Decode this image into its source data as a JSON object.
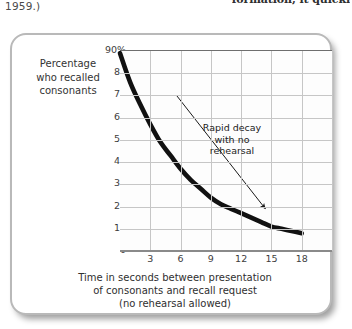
{
  "page": {
    "text_left": "1959.)",
    "text_right": "formation, it quickl"
  },
  "figure": {
    "y_axis_caption": "Percentage\nwho recalled\nconsonants",
    "x_axis_caption": "Time in seconds between presentation\nof consonants and recall request\n(no rehearsal allowed)",
    "annotation": "Rapid decay\nwith no\nrehearsal",
    "colors": {
      "curve": "#111111",
      "grid": "#c6c6c6",
      "axis": "#6e6e6e",
      "frame": "#b9b9b9",
      "text": "#333333"
    }
  },
  "chart_data": {
    "type": "line",
    "title": "",
    "xlabel": "Time in seconds between presentation of consonants and recall request (no rehearsal allowed)",
    "ylabel": "Percentage who recalled consonants",
    "xlim": [
      0,
      21
    ],
    "ylim": [
      0,
      90
    ],
    "xticks": [
      3,
      6,
      9,
      12,
      15,
      18
    ],
    "xtick_labels": [
      "3",
      "6",
      "9",
      "12",
      "15",
      "18"
    ],
    "yticks": [
      0,
      10,
      20,
      30,
      40,
      50,
      60,
      70,
      80,
      90
    ],
    "ytick_labels": [
      "0",
      "10",
      "20",
      "30",
      "40",
      "50",
      "60",
      "70",
      "80",
      "90%"
    ],
    "grid": true,
    "legend": null,
    "series": [
      {
        "name": "Percentage recalled",
        "x": [
          0,
          1,
          2,
          3,
          4,
          5,
          6,
          7,
          8,
          9,
          10,
          11,
          12,
          13,
          14,
          15,
          16,
          17,
          18
        ],
        "values": [
          89,
          76,
          66,
          57,
          49,
          43,
          37,
          32,
          28,
          24,
          21,
          19,
          17,
          15,
          13,
          11,
          10,
          9,
          8
        ]
      }
    ],
    "annotations": [
      {
        "text": "Rapid decay with no rehearsal",
        "arrow_from": [
          5.6,
          70
        ],
        "arrow_to": [
          14.4,
          19
        ]
      }
    ]
  }
}
